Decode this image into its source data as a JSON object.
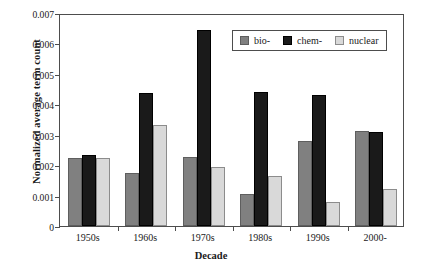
{
  "chart_data": {
    "type": "bar",
    "title": "",
    "xlabel": "Decade",
    "ylabel": "Normalized average term count",
    "categories": [
      "1950s",
      "1960s",
      "1970s",
      "1980s",
      "1990s",
      "2000-"
    ],
    "series": [
      {
        "name": "bio-",
        "color": "#808080",
        "values": [
          0.00224,
          0.00175,
          0.00227,
          0.00105,
          0.00278,
          0.00313
        ]
      },
      {
        "name": "chem-",
        "color": "#1a1a1a",
        "values": [
          0.00232,
          0.00437,
          0.00643,
          0.0044,
          0.00432,
          0.00309
        ]
      },
      {
        "name": "nuclear",
        "color": "#d9d9d9",
        "values": [
          0.00224,
          0.00333,
          0.00194,
          0.00163,
          0.00078,
          0.00122
        ]
      }
    ],
    "ylim": [
      0,
      0.007
    ],
    "yticks": [
      0,
      0.001,
      0.002,
      0.003,
      0.004,
      0.005,
      0.006,
      0.007
    ],
    "ytick_labels": [
      "0",
      "0.001",
      "0.002",
      "0.003",
      "0.004",
      "0.005",
      "0.006",
      "0.007"
    ],
    "grid": false,
    "legend_position": "top-right",
    "legend_entries": [
      "bio-",
      "chem-",
      "nuclear"
    ]
  }
}
